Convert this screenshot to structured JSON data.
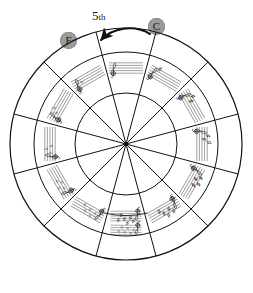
{
  "diagram": {
    "annotation": {
      "interval_label": "5",
      "interval_suffix": "th",
      "from_chip": "C",
      "to_chip": "F",
      "arrow": "curved-arrow-left"
    },
    "colors": {
      "chip_fill": "#9a9a9a",
      "chip_text": "#1a1a1a",
      "line": "#111111",
      "background": "#ffffff"
    }
  },
  "chart_data": {
    "type": "pie",
    "legend": "none",
    "grid": false,
    "segment_count": 12,
    "rings": [
      "outer-labels",
      "key-signature-ring",
      "relative-minor-ring"
    ],
    "categories": [
      "C",
      "G",
      "D",
      "A",
      "E",
      "B",
      "F#/Gb",
      "Db",
      "Ab",
      "Eb",
      "Bb",
      "F"
    ],
    "values": [
      30,
      30,
      30,
      30,
      30,
      30,
      30,
      30,
      30,
      30,
      30,
      30
    ],
    "segments": [
      {
        "angle": 0,
        "major": "C",
        "major_accidental": "",
        "minor": "Am",
        "minor_accidental": "",
        "accidental_type": "natural",
        "accidental_count": 0
      },
      {
        "angle": 30,
        "major": "G",
        "major_accidental": "",
        "minor": "Em",
        "minor_accidental": "",
        "accidental_type": "sharp",
        "accidental_count": 1
      },
      {
        "angle": 60,
        "major": "D",
        "major_accidental": "",
        "minor": "Bm",
        "minor_accidental": "",
        "accidental_type": "sharp",
        "accidental_count": 2
      },
      {
        "angle": 90,
        "major": "A",
        "major_accidental": "",
        "minor": "F",
        "minor_accidental": "♯",
        "minor_suffix": "m",
        "accidental_type": "sharp",
        "accidental_count": 3
      },
      {
        "angle": 120,
        "major": "E",
        "major_accidental": "",
        "minor": "C",
        "minor_accidental": "♯",
        "minor_suffix": "m",
        "accidental_type": "sharp",
        "accidental_count": 4
      },
      {
        "angle": 150,
        "major": "B",
        "major_accidental": "",
        "minor": "G",
        "minor_accidental": "♯",
        "minor_suffix": "m",
        "accidental_type": "sharp",
        "accidental_count": 5
      },
      {
        "angle": 180,
        "major": "F",
        "major_accidental": "♯",
        "major_alt": "G",
        "major_alt_accidental": "♭",
        "minor": "D",
        "minor_accidental": "♯",
        "minor_suffix": "m",
        "minor_alt": "E",
        "minor_alt_accidental": "♭",
        "minor_alt_suffix": "m",
        "accidental_type": "both",
        "accidental_count": 6
      },
      {
        "angle": 210,
        "major": "D",
        "major_accidental": "♭",
        "minor": "B",
        "minor_accidental": "♭",
        "minor_suffix": "m",
        "accidental_type": "flat",
        "accidental_count": 5
      },
      {
        "angle": 240,
        "major": "A",
        "major_accidental": "♭",
        "minor": "Fm",
        "minor_accidental": "",
        "accidental_type": "flat",
        "accidental_count": 4
      },
      {
        "angle": 270,
        "major": "E",
        "major_accidental": "♭",
        "minor": "Cm",
        "minor_accidental": "",
        "accidental_type": "flat",
        "accidental_count": 3
      },
      {
        "angle": 300,
        "major": "B",
        "major_accidental": "♭",
        "minor": "Gm",
        "minor_accidental": "",
        "accidental_type": "flat",
        "accidental_count": 2
      },
      {
        "angle": 330,
        "major": "F",
        "major_accidental": "",
        "minor": "Dm",
        "minor_accidental": "",
        "accidental_type": "flat",
        "accidental_count": 1
      }
    ],
    "outer_labels": [
      {
        "text": "C",
        "position": "top",
        "hidden": true
      },
      {
        "text": "G",
        "position": "top-right"
      },
      {
        "text": "D",
        "position": "upper-right"
      },
      {
        "text": "A",
        "position": "right"
      },
      {
        "text": "E",
        "position": "lower-right"
      },
      {
        "text": "B",
        "position": "bottom-right"
      },
      {
        "text": "F♯",
        "position": "bottom"
      },
      {
        "text": "G♭",
        "position": "bottom-below"
      },
      {
        "text": "D♭",
        "position": "bottom-left"
      },
      {
        "text": "A♭",
        "position": "lower-left"
      },
      {
        "text": "E♭",
        "position": "left"
      },
      {
        "text": "B♭",
        "position": "upper-left"
      }
    ],
    "inner_labels": [
      "Am",
      "Em",
      "Bm",
      "F♯m",
      "C♯m",
      "G♯m",
      "D♯m",
      "E♭m",
      "B♭m",
      "Fm",
      "Cm",
      "Gm",
      "Dm"
    ]
  }
}
